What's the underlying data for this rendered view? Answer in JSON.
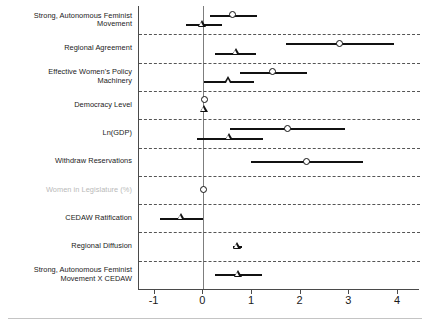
{
  "chart_data": {
    "type": "scatter",
    "title": "",
    "subtitle": "",
    "xlabel": "",
    "ylabel": "",
    "xlim": [
      -1.32,
      4.45
    ],
    "xticks": [
      -1,
      0,
      1,
      2,
      3,
      4
    ],
    "xtick_labels": [
      "-1",
      "0",
      "1",
      "2",
      "3",
      "4"
    ],
    "grid": "horizontal dashed separators between variable rows",
    "reference_line": 0,
    "legend": [],
    "marker_semantics": {
      "circle": "model-1 estimate (open circle)",
      "triangle": "model-2 estimate (open triangle)"
    },
    "categories": [
      "Strong, Autonomous Feminist\nMovement",
      "Regional Agreement",
      "Effective Women's Policy\nMachinery",
      "Democracy Level",
      "Ln(GDP)",
      "Withdraw Reservations",
      "Women in Legislature (%)",
      "CEDAW Ratification",
      "Regional Diffusion",
      "Strong, Autonomous Feminist\nMovement X CEDAW"
    ],
    "rows": [
      {
        "label": "Strong, Autonomous Feminist\nMovement",
        "faded": false,
        "estimates": [
          {
            "marker": "circle",
            "value": 0.6,
            "ci_low": 0.14,
            "ci_high": 1.11
          },
          {
            "marker": "triangle",
            "value": -0.02,
            "ci_low": -0.35,
            "ci_high": 0.38
          }
        ]
      },
      {
        "label": "Regional Agreement",
        "faded": false,
        "estimates": [
          {
            "marker": "circle",
            "value": 2.8,
            "ci_low": 1.7,
            "ci_high": 3.92
          },
          {
            "marker": "triangle",
            "value": 0.68,
            "ci_low": 0.24,
            "ci_high": 1.09
          }
        ]
      },
      {
        "label": "Effective Women's Policy\nMachinery",
        "faded": false,
        "estimates": [
          {
            "marker": "circle",
            "value": 1.42,
            "ci_low": 0.76,
            "ci_high": 2.14
          },
          {
            "marker": "triangle",
            "value": 0.52,
            "ci_low": 0.01,
            "ci_high": 1.05
          }
        ]
      },
      {
        "label": "Democracy Level",
        "faded": false,
        "estimates": [
          {
            "marker": "circle",
            "value": 0.02,
            "ci_low": 0.0,
            "ci_high": 0.04
          },
          {
            "marker": "triangle",
            "value": 0.02,
            "ci_low": 0.0,
            "ci_high": 0.04
          }
        ]
      },
      {
        "label": "Ln(GDP)",
        "faded": false,
        "estimates": [
          {
            "marker": "circle",
            "value": 1.72,
            "ci_low": 0.54,
            "ci_high": 2.9
          },
          {
            "marker": "triangle",
            "value": 0.53,
            "ci_low": -0.12,
            "ci_high": 1.22
          }
        ]
      },
      {
        "label": "Withdraw Reservations",
        "faded": false,
        "estimates": [
          {
            "marker": "circle",
            "value": 2.12,
            "ci_low": 0.97,
            "ci_high": 3.27
          }
        ]
      },
      {
        "label": "Women in Legislature (%)",
        "faded": true,
        "estimates": [
          {
            "marker": "circle",
            "value": 0.01,
            "ci_low": -0.01,
            "ci_high": 0.03
          }
        ]
      },
      {
        "label": "CEDAW Ratification",
        "faded": false,
        "estimates": [
          {
            "marker": "triangle",
            "value": -0.45,
            "ci_low": -0.88,
            "ci_high": 0.0
          }
        ]
      },
      {
        "label": "Regional Diffusion",
        "faded": false,
        "estimates": [
          {
            "marker": "triangle",
            "value": 0.7,
            "ci_low": 0.62,
            "ci_high": 0.8
          }
        ]
      },
      {
        "label": "Strong, Autonomous Feminist\nMovement X CEDAW",
        "faded": false,
        "estimates": [
          {
            "marker": "triangle",
            "value": 0.72,
            "ci_low": 0.25,
            "ci_high": 1.2
          }
        ]
      }
    ]
  }
}
